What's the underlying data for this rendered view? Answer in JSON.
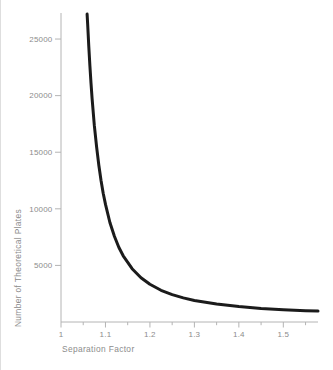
{
  "figure": {
    "background": "#ffffff",
    "axis_color": "#b4b4b4",
    "label_color": "#8c8c8c",
    "curve_color": "#1b1b1b",
    "scan_edge_color": "#dedede"
  },
  "chart_data": {
    "type": "line",
    "xlabel": "Separation Factor",
    "ylabel": "Number of Theoretical Plates",
    "xlim": [
      1.0,
      1.578
    ],
    "ylim": [
      0,
      27300
    ],
    "grid": false,
    "legend": "none",
    "x_major_ticks": [
      1.0,
      1.1,
      1.2,
      1.3,
      1.4,
      1.5
    ],
    "x_tick_labels": [
      "1",
      "1.1",
      "1.2",
      "1.3",
      "1.4",
      "1.5"
    ],
    "x_minor_ticks": [
      1.05,
      1.15,
      1.25,
      1.35,
      1.45,
      1.55
    ],
    "y_ticks": [
      5000,
      10000,
      15000,
      20000,
      25000
    ],
    "y_tick_labels": [
      "5000",
      "10000",
      "15000",
      "20000",
      "25000"
    ],
    "series": [
      {
        "name": "required-plates-vs-separation-factor",
        "x": [
          1.0588,
          1.06,
          1.0625,
          1.065,
          1.0675,
          1.07,
          1.075,
          1.08,
          1.085,
          1.09,
          1.095,
          1.1,
          1.11,
          1.12,
          1.13,
          1.14,
          1.16,
          1.18,
          1.2,
          1.225,
          1.25,
          1.275,
          1.3,
          1.35,
          1.4,
          1.45,
          1.5,
          1.55,
          1.578
        ],
        "y": [
          27200,
          26250,
          24330,
          22630,
          21100,
          19740,
          17390,
          15470,
          13870,
          12520,
          11370,
          10390,
          8795,
          7570,
          6610,
          5850,
          4710,
          3910,
          3330,
          2800,
          2420,
          2130,
          1900,
          1580,
          1360,
          1200,
          1090,
          1000,
          965
        ]
      }
    ]
  }
}
